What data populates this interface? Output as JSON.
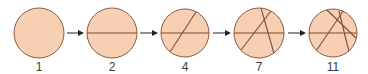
{
  "diagram": {
    "colors": {
      "fill": "#f7cfb3",
      "stroke": "#8b5a3c",
      "cut": "#7a5038",
      "arrow": "#222222",
      "label": "#3a3a3a"
    },
    "circles": [
      {
        "label": "1",
        "cx": 39,
        "cy": 33,
        "r": 25,
        "cuts": []
      },
      {
        "label": "2",
        "cx": 112,
        "cy": 33,
        "r": 25,
        "cuts": [
          [
            87,
            33,
            137,
            33
          ]
        ]
      },
      {
        "label": "4",
        "cx": 185,
        "cy": 33,
        "r": 24,
        "cuts": [
          [
            161,
            33,
            209,
            33
          ],
          [
            196,
            12,
            170,
            52
          ]
        ]
      },
      {
        "label": "7",
        "cx": 259,
        "cy": 33,
        "r": 25,
        "cuts": [
          [
            234,
            33,
            284,
            33
          ],
          [
            271,
            11,
            241,
            50
          ],
          [
            261,
            8,
            275,
            57
          ]
        ]
      },
      {
        "label": "11",
        "cx": 333,
        "cy": 33,
        "r": 24,
        "cuts": [
          [
            309,
            33,
            357,
            33
          ],
          [
            344,
            10,
            316,
            51
          ],
          [
            327,
            10,
            356,
            38
          ],
          [
            339,
            11,
            350,
            56
          ]
        ]
      }
    ],
    "arrows": [
      {
        "x1": 67,
        "x2": 84
      },
      {
        "x1": 140,
        "x2": 158
      },
      {
        "x1": 213,
        "x2": 231
      },
      {
        "x1": 288,
        "x2": 306
      }
    ]
  }
}
